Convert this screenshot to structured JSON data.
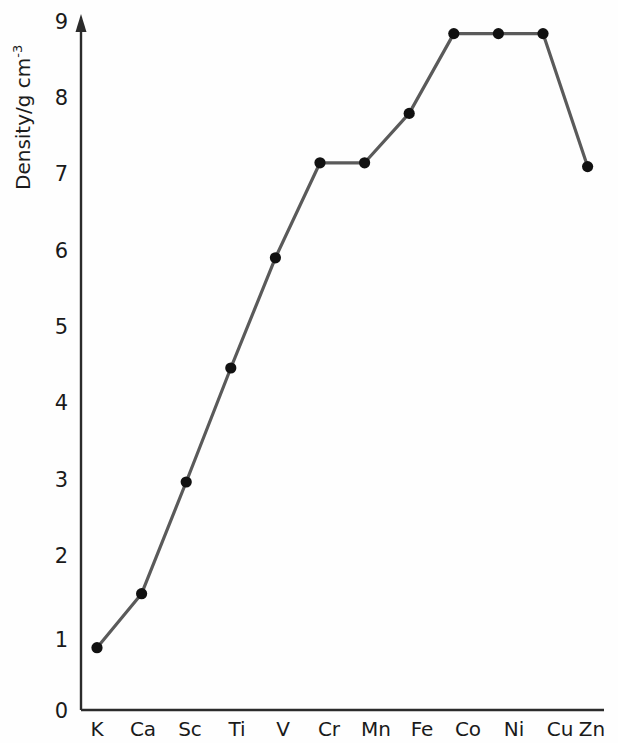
{
  "chart_data": {
    "type": "line",
    "title": "",
    "subtitle": "",
    "xlabel": "",
    "ylabel": "Density/g cm",
    "ylabel_exponent": "-3",
    "ylabel_full": "Density/g cm-3",
    "categories": [
      "K",
      "Ca",
      "Sc",
      "Ti",
      "V",
      "Cr",
      "Mn",
      "Fe",
      "Co",
      "Ni",
      "Cu",
      "Zn"
    ],
    "values": [
      0.82,
      1.53,
      3.0,
      4.5,
      5.95,
      7.2,
      7.2,
      7.85,
      8.9,
      8.9,
      8.9,
      7.15
    ],
    "series": [
      {
        "name": "Density",
        "values": [
          0.82,
          1.53,
          3.0,
          4.5,
          5.95,
          7.2,
          7.2,
          7.85,
          8.9,
          8.9,
          8.9,
          7.15
        ]
      }
    ],
    "ylim": [
      0,
      9
    ],
    "yticks": [
      0,
      1,
      2,
      3,
      4,
      5,
      6,
      7,
      8,
      9
    ],
    "ytick_labels": [
      "0",
      "1",
      "2",
      "3",
      "4",
      "5",
      "6",
      "7",
      "8",
      "9"
    ],
    "xtick_labels": [
      "K",
      "Ca",
      "Sc",
      "Ti",
      "V",
      "Cr",
      "Mn",
      "Fe",
      "Co",
      "Ni",
      "Cu",
      "Zn"
    ],
    "grid": false,
    "legend": false,
    "legend_position": "none",
    "marker": "filled-circle",
    "line_color": "#5a5a5a",
    "marker_color": "#111111",
    "axis_color": "#2b2b2b",
    "background_color": "#fefefe",
    "y_axis_arrow": true,
    "annotations": []
  },
  "axis": {
    "y_axis_name": "y-axis",
    "x_axis_name": "x-axis"
  }
}
